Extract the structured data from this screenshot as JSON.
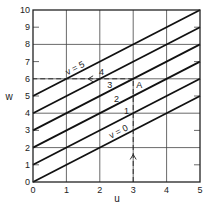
{
  "chart_data": {
    "type": "line",
    "title": "",
    "xlabel": "u",
    "ylabel": "w",
    "xlim": [
      0,
      5
    ],
    "ylim": [
      0,
      10
    ],
    "x_ticks": [
      "0",
      "1",
      "2",
      "3",
      "4",
      "5"
    ],
    "y_ticks": [
      "0",
      "1",
      "2",
      "3",
      "4",
      "5",
      "6",
      "7",
      "8",
      "9",
      "10"
    ],
    "grid": {
      "x": [
        1,
        2,
        3,
        4
      ],
      "y": [
        2,
        4,
        6,
        8
      ]
    },
    "relation": "w = u + v",
    "series": [
      {
        "name": "v = 0",
        "label": "v = 0",
        "v": 0,
        "x": [
          0,
          5
        ],
        "y": [
          0,
          5
        ]
      },
      {
        "name": "v = 1",
        "label": "1",
        "v": 1,
        "x": [
          0,
          5
        ],
        "y": [
          1,
          6
        ]
      },
      {
        "name": "v = 2",
        "label": "2",
        "v": 2,
        "x": [
          0,
          5
        ],
        "y": [
          2,
          7
        ]
      },
      {
        "name": "v = 3",
        "label": "3",
        "v": 3,
        "x": [
          0,
          5
        ],
        "y": [
          3,
          8
        ]
      },
      {
        "name": "v = 4",
        "label": "4",
        "v": 4,
        "x": [
          0,
          5
        ],
        "y": [
          4,
          9
        ]
      },
      {
        "name": "v = 5",
        "label": "v = 5",
        "v": 5,
        "x": [
          0,
          5
        ],
        "y": [
          5,
          10
        ]
      }
    ],
    "annotations": [
      {
        "label": "A",
        "x": 3,
        "y": 6
      },
      {
        "type": "dashed-arrow",
        "from": [
          3,
          0
        ],
        "to": [
          3,
          6
        ],
        "direction": "up"
      },
      {
        "type": "dashed-arrow",
        "from": [
          3,
          6
        ],
        "to": [
          0,
          6
        ],
        "direction": "left"
      }
    ]
  }
}
